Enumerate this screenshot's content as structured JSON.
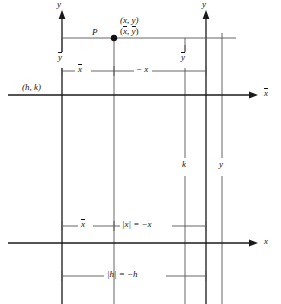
{
  "figure": {
    "background_color": "#ffffff",
    "line_color": "#1a1a1a",
    "text_color": "#111111"
  },
  "axes": {
    "xbar_axis_label": "x",
    "ybar_axis_label": "y",
    "x_axis_label": "x",
    "y_axis_label": "y",
    "origin_label": "(h, k)"
  },
  "point": {
    "name_label": "P",
    "coord_xy": "(x, y)",
    "coord_xbar_ybar_open": "(",
    "coord_xbar_ybar_x": "x",
    "coord_xbar_ybar_comma": ", ",
    "coord_xbar_ybar_y": "y",
    "coord_xbar_ybar_close": ")"
  },
  "dimension_labels": {
    "ybar_upper_left": "y",
    "ybar_upper_right": "y",
    "xbar_upper": "x",
    "minus_x_upper": "− x",
    "xbar_lower": "x",
    "abs_x_equals_minus_x": "|x| = −x",
    "abs_h_equals_minus_h": "|h| = −h",
    "k_label": "k",
    "y_label": "y"
  },
  "geometry": {
    "xbar_axis_y": 95,
    "x_axis_y": 243,
    "ybar_axis_x": 62,
    "y_axis_x": 206,
    "point_x": 114,
    "point_y": 38,
    "line_k_x": 185,
    "line_y_x": 222,
    "upper_dim_y": 71,
    "lower_dim_y": 226,
    "bottom_dim_y": 276
  }
}
